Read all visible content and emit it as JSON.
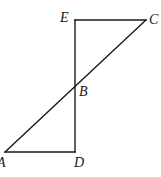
{
  "diagram": {
    "type": "geometry-figure",
    "points": {
      "E": {
        "label": "E",
        "x": 75,
        "y": 20
      },
      "C": {
        "label": "C",
        "x": 146,
        "y": 20
      },
      "B": {
        "label": "B",
        "x": 75,
        "y": 87
      },
      "A": {
        "label": "A",
        "x": 5,
        "y": 152
      },
      "D": {
        "label": "D",
        "x": 75,
        "y": 152
      }
    },
    "segments": [
      {
        "from": "E",
        "to": "C"
      },
      {
        "from": "E",
        "to": "D"
      },
      {
        "from": "A",
        "to": "C"
      },
      {
        "from": "A",
        "to": "D"
      }
    ],
    "labels": {
      "E": "E",
      "C": "C",
      "B": "B",
      "A": "A",
      "D": "D"
    },
    "colors": {
      "stroke": "#1a1a1a",
      "background": "#ffffff"
    }
  }
}
